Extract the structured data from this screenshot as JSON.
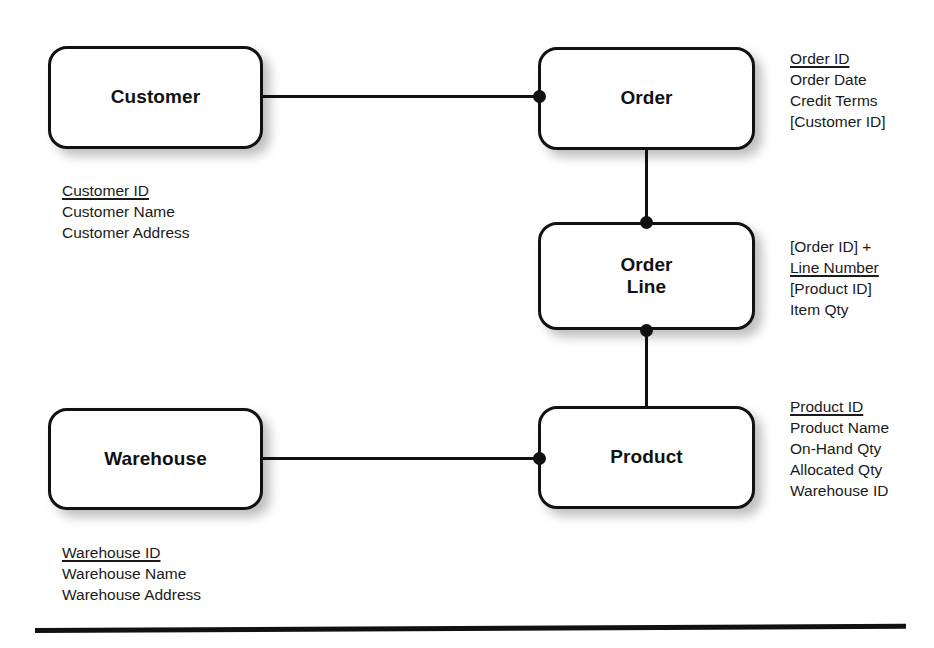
{
  "diagram": {
    "entities": [
      {
        "id": "customer",
        "label": "Customer",
        "attributes": [
          {
            "text": "Customer ID",
            "key": true
          },
          {
            "text": "Customer Name",
            "key": false
          },
          {
            "text": "Customer Address",
            "key": false
          }
        ]
      },
      {
        "id": "order",
        "label": "Order",
        "attributes": [
          {
            "text": "Order ID",
            "key": true
          },
          {
            "text": "Order Date",
            "key": false
          },
          {
            "text": "Credit Terms",
            "key": false
          },
          {
            "text": "[Customer ID]",
            "key": false
          }
        ]
      },
      {
        "id": "order-line",
        "label": "Order\nLine",
        "attributes": [
          {
            "text": "[Order ID] +",
            "key": false
          },
          {
            "text": "Line Number",
            "key": true
          },
          {
            "text": "[Product ID]",
            "key": false
          },
          {
            "text": "Item Qty",
            "key": false
          }
        ]
      },
      {
        "id": "product",
        "label": "Product",
        "attributes": [
          {
            "text": "Product ID",
            "key": true
          },
          {
            "text": "Product Name",
            "key": false
          },
          {
            "text": "On-Hand Qty",
            "key": false
          },
          {
            "text": "Allocated Qty",
            "key": false
          },
          {
            "text": "Warehouse ID",
            "key": false
          }
        ]
      },
      {
        "id": "warehouse",
        "label": "Warehouse",
        "attributes": [
          {
            "text": "Warehouse ID",
            "key": true
          },
          {
            "text": "Warehouse Name",
            "key": false
          },
          {
            "text": "Warehouse Address",
            "key": false
          }
        ]
      }
    ],
    "relationships": [
      {
        "id": "customer-order",
        "from": "customer",
        "to": "order",
        "many_end": "order"
      },
      {
        "id": "order-order-line",
        "from": "order",
        "to": "order-line",
        "many_end": "order-line"
      },
      {
        "id": "order-line-product",
        "from": "order-line",
        "to": "product",
        "many_end": "order-line"
      },
      {
        "id": "warehouse-product",
        "from": "warehouse",
        "to": "product",
        "many_end": "product"
      }
    ],
    "colors": {
      "line": "#111111",
      "box_border": "#111111",
      "box_fill": "#ffffff",
      "text": "#1a1a1a"
    }
  }
}
